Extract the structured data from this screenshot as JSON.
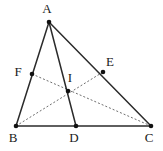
{
  "figure": {
    "type": "geometry-diagram",
    "background_color": "#ffffff",
    "canvas": {
      "width": 163,
      "height": 151
    },
    "solid_color": "#2b2b2b",
    "dotted_color": "#6f6f6f",
    "point_color": "#111111",
    "points": {
      "A": {
        "label": "A",
        "x": 49,
        "y": 22,
        "label_x": 47,
        "label_y": 13
      },
      "B": {
        "label": "B",
        "x": 16,
        "y": 126,
        "label_x": 13,
        "label_y": 142
      },
      "C": {
        "label": "C",
        "x": 151,
        "y": 126,
        "label_x": 149,
        "label_y": 142
      },
      "D": {
        "label": "D",
        "x": 76,
        "y": 126,
        "label_x": 74,
        "label_y": 142
      },
      "E": {
        "label": "E",
        "x": 103,
        "y": 72,
        "label_x": 110,
        "label_y": 66
      },
      "F": {
        "label": "F",
        "x": 32,
        "y": 74,
        "label_x": 18,
        "label_y": 76
      },
      "I": {
        "label": "I",
        "x": 68,
        "y": 91,
        "label_x": 70,
        "label_y": 82
      }
    },
    "solid_segments": [
      {
        "name": "side-AB",
        "from": "A",
        "to": "B"
      },
      {
        "name": "side-AC",
        "from": "A",
        "to": "C"
      },
      {
        "name": "side-BC",
        "from": "B",
        "to": "C"
      },
      {
        "name": "cevian-AD",
        "from": "A",
        "to": "D"
      }
    ],
    "dotted_segments": [
      {
        "name": "cevian-FC",
        "from": "F",
        "to": "C"
      },
      {
        "name": "cevian-BE",
        "from": "B",
        "to": "E"
      }
    ],
    "notes": {
      "concurrency_point": "I",
      "F_on": "AB",
      "E_on": "AC",
      "D_on": "BC"
    }
  }
}
